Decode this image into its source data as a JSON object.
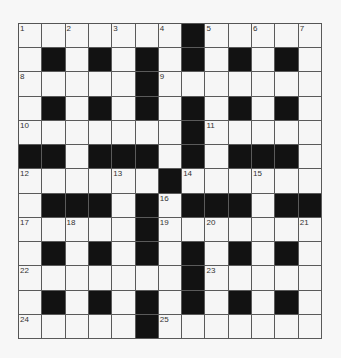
{
  "puzzle": {
    "rows": 13,
    "cols": 13,
    "colors": {
      "black": "#121212",
      "white": "#f6f6f6",
      "line": "#5a5a5a"
    },
    "layout": [
      "WWWWWWWBWWWWW",
      "WBWBWBWBWBWBW",
      "WWWWWBWWWWWWW",
      "WBWBWBWBWBWBW",
      "WWWWWWWBWWWWW",
      "BBWBBBWBWBBBW",
      "WWWWWWBWWWWWW",
      "WBBBWBWBBBWBB",
      "WWWWWBWWWWWWW",
      "WBWBWBWBWBWBW",
      "WWWWWWWBWWWWW",
      "WBWBWBWBWBWBW",
      "WWWWWBWWWWWWW"
    ],
    "numbers": [
      {
        "r": 0,
        "c": 0,
        "n": "1"
      },
      {
        "r": 0,
        "c": 2,
        "n": "2"
      },
      {
        "r": 0,
        "c": 4,
        "n": "3"
      },
      {
        "r": 0,
        "c": 6,
        "n": "4"
      },
      {
        "r": 0,
        "c": 8,
        "n": "5"
      },
      {
        "r": 0,
        "c": 10,
        "n": "6"
      },
      {
        "r": 0,
        "c": 12,
        "n": "7"
      },
      {
        "r": 2,
        "c": 0,
        "n": "8"
      },
      {
        "r": 2,
        "c": 6,
        "n": "9"
      },
      {
        "r": 4,
        "c": 0,
        "n": "10"
      },
      {
        "r": 4,
        "c": 8,
        "n": "11"
      },
      {
        "r": 6,
        "c": 0,
        "n": "12"
      },
      {
        "r": 6,
        "c": 4,
        "n": "13"
      },
      {
        "r": 6,
        "c": 7,
        "n": "14"
      },
      {
        "r": 6,
        "c": 10,
        "n": "15"
      },
      {
        "r": 7,
        "c": 6,
        "n": "16"
      },
      {
        "r": 8,
        "c": 0,
        "n": "17"
      },
      {
        "r": 8,
        "c": 2,
        "n": "18"
      },
      {
        "r": 8,
        "c": 6,
        "n": "19"
      },
      {
        "r": 8,
        "c": 8,
        "n": "20"
      },
      {
        "r": 8,
        "c": 12,
        "n": "21"
      },
      {
        "r": 10,
        "c": 0,
        "n": "22"
      },
      {
        "r": 10,
        "c": 8,
        "n": "23"
      },
      {
        "r": 12,
        "c": 0,
        "n": "24"
      },
      {
        "r": 12,
        "c": 6,
        "n": "25"
      }
    ]
  }
}
